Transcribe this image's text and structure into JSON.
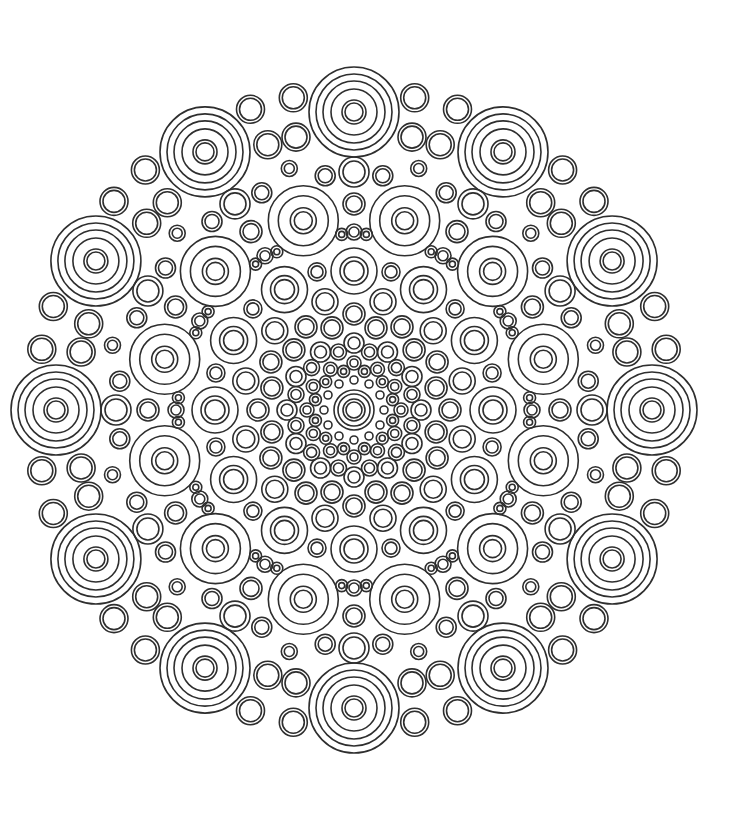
{
  "page": {
    "background": "#ffffff"
  },
  "mandala": {
    "center": [
      354,
      410
    ],
    "symmetry": 12,
    "stroke_color": "#2e2e2e",
    "stroke_width": 1.6,
    "layers": [
      {
        "name": "center-medallion",
        "distance": 0,
        "count": 1,
        "offsets": [
          0
        ],
        "rings": [
          20,
          16,
          11,
          8
        ]
      },
      {
        "name": "inner-dot",
        "distance": 30,
        "offsets": [
          0
        ],
        "rings": [
          4
        ]
      },
      {
        "name": "inner-small-a",
        "distance": 40,
        "offsets": [
          15
        ],
        "rings": [
          6,
          3
        ]
      },
      {
        "name": "inner-small-b",
        "distance": 47,
        "offsets": [
          0
        ],
        "rings": [
          7,
          4
        ]
      },
      {
        "name": "inner-small-c",
        "distance": 60,
        "offsets": [
          15
        ],
        "rings": [
          8,
          5
        ]
      },
      {
        "name": "inner-small-d",
        "distance": 67,
        "offsets": [
          0
        ],
        "rings": [
          10,
          6
        ]
      },
      {
        "name": "inner-mid-a",
        "distance": 85,
        "offsets": [
          15
        ],
        "rings": [
          11,
          8
        ]
      },
      {
        "name": "inner-mid-b",
        "distance": 96,
        "offsets": [
          0
        ],
        "rings": [
          11,
          8
        ]
      },
      {
        "name": "inner-mid-c",
        "distance": 112,
        "offsets": [
          15
        ],
        "rings": [
          13,
          9
        ]
      },
      {
        "name": "ring3-medallion",
        "distance": 139,
        "offsets": [
          0
        ],
        "rings": [
          23,
          14,
          10
        ]
      },
      {
        "name": "ring3-between",
        "distance": 143,
        "offsets": [
          15
        ],
        "rings": [
          9,
          6
        ]
      },
      {
        "name": "spoke-filler-a",
        "distance": 178,
        "offsets": [
          0
        ],
        "rings": [
          8,
          5
        ]
      },
      {
        "name": "spoke-filler-b",
        "distance": 206,
        "offsets": [
          0
        ],
        "rings": [
          11,
          8
        ]
      },
      {
        "name": "spoke-filler-c",
        "distance": 238,
        "offsets": [
          0
        ],
        "rings": [
          15,
          11
        ]
      },
      {
        "name": "ring2-medallion",
        "distance": 196,
        "offsets": [
          15
        ],
        "rings": [
          35,
          25,
          13,
          9
        ]
      },
      {
        "name": "ring2-side",
        "distance": 176,
        "offsets": [
          4,
          26
        ],
        "rings": [
          6,
          3
        ]
      },
      {
        "name": "outer-filler-single",
        "distance": 250,
        "offsets": [
          15
        ],
        "rings": [
          8,
          5
        ]
      },
      {
        "name": "outer-filler-side",
        "distance": 236,
        "offsets": [
          7,
          23
        ],
        "rings": [
          10,
          7
        ]
      },
      {
        "name": "outer-filler-pair-inner",
        "distance": 279,
        "offsets": [
          12,
          18
        ],
        "rings": [
          14,
          11
        ]
      },
      {
        "name": "outer-filler-pair-outer",
        "distance": 318,
        "offsets": [
          11,
          19
        ],
        "rings": [
          14,
          11
        ]
      },
      {
        "name": "outer-medallion",
        "distance": 298,
        "offsets": [
          0
        ],
        "rings": [
          45,
          38,
          31,
          23,
          12,
          9
        ]
      }
    ]
  }
}
